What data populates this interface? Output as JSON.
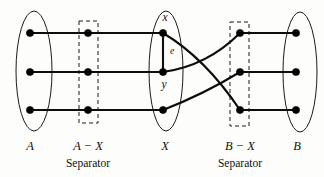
{
  "figure": {
    "width": 324,
    "height": 177,
    "background": "#fdfdfc",
    "ink_color": "#0d0d0d"
  },
  "groups": [
    {
      "id": "A",
      "label": "A",
      "sublabel": "",
      "shape": "ellipse",
      "label_x": 30,
      "label_y": 140,
      "ellipse": {
        "cx": 34,
        "cy": 71,
        "rx": 18,
        "ry": 60
      },
      "nodes_x": 30,
      "nodes_y": [
        33,
        72,
        110
      ]
    },
    {
      "id": "A-X",
      "label": "A − X",
      "sublabel": "Separator",
      "shape": "dashed-box",
      "label_x": 88,
      "label_y": 140,
      "sublabel_x": 88,
      "sublabel_y": 158,
      "box": {
        "x": 79,
        "y": 21,
        "w": 19,
        "h": 102
      },
      "nodes_x": 88,
      "nodes_y": [
        33,
        72,
        110
      ]
    },
    {
      "id": "X",
      "label": "X",
      "sublabel": "",
      "shape": "ellipse",
      "label_x": 165,
      "label_y": 140,
      "ellipse": {
        "cx": 166,
        "cy": 71,
        "rx": 17,
        "ry": 60
      },
      "nodes_x": 163,
      "nodes_y": [
        33,
        72,
        110
      ]
    },
    {
      "id": "B-X",
      "label": "B − X",
      "sublabel": "Separator",
      "shape": "dashed-box",
      "label_x": 240,
      "label_y": 140,
      "sublabel_x": 240,
      "sublabel_y": 158,
      "box": {
        "x": 230,
        "y": 22,
        "w": 19,
        "h": 104
      },
      "nodes_x": 240,
      "nodes_y": [
        33,
        72,
        110
      ]
    },
    {
      "id": "B",
      "label": "B",
      "sublabel": "",
      "shape": "ellipse",
      "label_x": 297,
      "label_y": 140,
      "ellipse": {
        "cx": 300,
        "cy": 72,
        "rx": 17,
        "ry": 60
      },
      "nodes_x": 296,
      "nodes_y": [
        33,
        72,
        110
      ]
    }
  ],
  "node_labels": [
    {
      "id": "x",
      "text": "x",
      "x": 165,
      "y": 12
    },
    {
      "id": "y",
      "text": "y",
      "x": 164,
      "y": 79
    }
  ],
  "edge_labels": [
    {
      "id": "e",
      "text": "e",
      "x": 172,
      "y": 47
    }
  ],
  "edges": [
    {
      "id": "A1-AX1",
      "type": "line",
      "x1": 30,
      "y1": 33,
      "x2": 88,
      "y2": 33
    },
    {
      "id": "A2-AX2",
      "type": "line",
      "x1": 30,
      "y1": 72,
      "x2": 88,
      "y2": 72
    },
    {
      "id": "A3-AX3",
      "type": "line",
      "x1": 30,
      "y1": 110,
      "x2": 88,
      "y2": 110
    },
    {
      "id": "AX1-X1",
      "type": "line",
      "x1": 88,
      "y1": 33,
      "x2": 163,
      "y2": 33
    },
    {
      "id": "AX2-X2",
      "type": "line",
      "x1": 88,
      "y1": 72,
      "x2": 163,
      "y2": 72
    },
    {
      "id": "AX3-X3",
      "type": "line",
      "x1": 88,
      "y1": 110,
      "x2": 163,
      "y2": 110
    },
    {
      "id": "x-y",
      "type": "line",
      "x1": 163,
      "y1": 33,
      "x2": 163,
      "y2": 72
    },
    {
      "id": "x-BX3",
      "type": "curve",
      "x1": 163,
      "y1": 33,
      "cx": 205,
      "cy": 58,
      "x2": 240,
      "y2": 110
    },
    {
      "id": "y-BX1",
      "type": "curve",
      "x1": 163,
      "y1": 72,
      "cx": 207,
      "cy": 66,
      "x2": 240,
      "y2": 33
    },
    {
      "id": "X3-BX2",
      "type": "curve",
      "x1": 163,
      "y1": 110,
      "cx": 204,
      "cy": 94,
      "x2": 240,
      "y2": 72
    },
    {
      "id": "BX1-B1",
      "type": "line",
      "x1": 240,
      "y1": 33,
      "x2": 296,
      "y2": 33
    },
    {
      "id": "BX2-B2",
      "type": "line",
      "x1": 240,
      "y1": 72,
      "x2": 296,
      "y2": 72
    },
    {
      "id": "BX3-B3",
      "type": "line",
      "x1": 240,
      "y1": 110,
      "x2": 296,
      "y2": 110
    }
  ],
  "node_radius": 3.6
}
